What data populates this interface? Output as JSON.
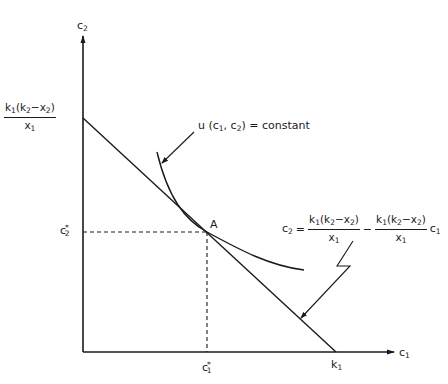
{
  "diagram": {
    "type": "consumer-choice-budget-line",
    "axes": {
      "x_label": "c",
      "x_label_sub": "1",
      "y_label": "c",
      "y_label_sub": "2"
    },
    "y_intercept": {
      "numerator": {
        "k": "k",
        "k_sub": "1",
        "open": "(k",
        "k2_sub": "2",
        "minus": "−x",
        "x2_sub": "2",
        "close": ")"
      },
      "denominator": {
        "x": "x",
        "x_sub": "1"
      }
    },
    "x_intercept": {
      "text": "k",
      "sub": "1"
    },
    "optimum": {
      "point_label": "A",
      "c1_star": {
        "text": "c",
        "sub": "1",
        "sup": "*"
      },
      "c2_star": {
        "text": "c",
        "sub": "2",
        "sup": "*"
      }
    },
    "indifference_curve_label": {
      "u": "u (c",
      "sub1": "1",
      "mid": ", c",
      "sub2": "2",
      "tail": ") = constant"
    },
    "budget_equation": {
      "lhs": "c",
      "lhs_sub": "2",
      "equals": "=",
      "minus": "−",
      "term_coef": "c",
      "term_coef_sub": "1"
    },
    "colors": {
      "ink": "#1a1a1a",
      "background": "#ffffff"
    }
  }
}
